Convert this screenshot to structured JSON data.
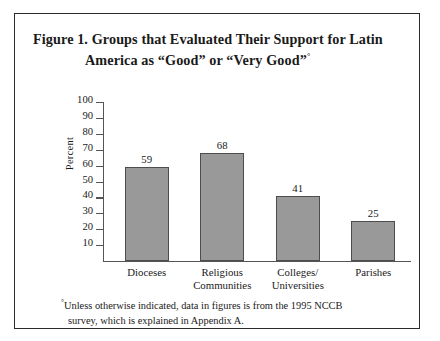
{
  "figure": {
    "title_line1": "Figure 1.  Groups that Evaluated Their Support for Latin",
    "title_line2": "America as “Good” or “Very Good”",
    "title_footnote_mark": "°",
    "footnote_mark": "°",
    "footnote_line1": "Unless otherwise indicated, data in figures is from the 1995 NCCB",
    "footnote_line2": "survey, which is explained in Appendix A."
  },
  "chart_data": {
    "type": "bar",
    "title": "Figure 1. Groups that Evaluated Their Support for Latin America as “Good” or “Very Good”",
    "xlabel": "",
    "ylabel": "Percent",
    "ylim": [
      0,
      100
    ],
    "yticks": [
      10,
      20,
      30,
      40,
      50,
      60,
      70,
      80,
      90,
      100
    ],
    "ytick_labels": [
      "10",
      "20",
      "30",
      "40",
      "50",
      "60",
      "70",
      "80",
      "90",
      "100"
    ],
    "grid": false,
    "legend": "none",
    "bar_color": "#999999",
    "bar_edge_color": "#4d4d4d",
    "categories": [
      "Dioceses",
      "Religious Communities",
      "Colleges/ Universities",
      "Parishes"
    ],
    "category_lines": [
      [
        "Dioceses"
      ],
      [
        "Religious",
        "Communities"
      ],
      [
        "Colleges/",
        "Universities"
      ],
      [
        "Parishes"
      ]
    ],
    "values": [
      59,
      68,
      41,
      25
    ],
    "value_labels": [
      "59",
      "68",
      "41",
      "25"
    ]
  }
}
